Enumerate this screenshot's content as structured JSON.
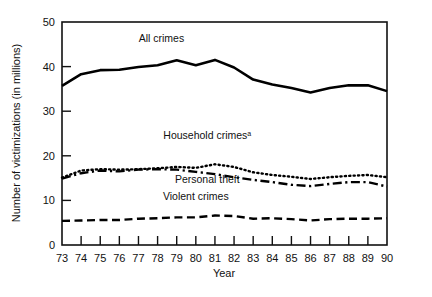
{
  "chart_data": {
    "type": "line",
    "title": "",
    "subtitle": "",
    "xlabel": "Year",
    "ylabel": "Number of victimizations (in millions)",
    "xlim": [
      73,
      90
    ],
    "ylim": [
      0,
      50
    ],
    "grid": false,
    "legend_position": "inline-annotations",
    "x": [
      73,
      74,
      75,
      76,
      77,
      78,
      79,
      80,
      81,
      82,
      83,
      84,
      85,
      86,
      87,
      88,
      89,
      90
    ],
    "xtick_labels": [
      "73",
      "74",
      "75",
      "76",
      "77",
      "78",
      "79",
      "80",
      "81",
      "82",
      "83",
      "84",
      "85",
      "86",
      "87",
      "88",
      "89",
      "90"
    ],
    "ytick_labels": [
      "0",
      "10",
      "20",
      "30",
      "40",
      "50"
    ],
    "yticks": [
      0,
      10,
      20,
      30,
      40,
      50
    ],
    "series": [
      {
        "name": "All crimes",
        "style": "solid",
        "color": "#000000",
        "label_text": "All crimes",
        "label_superscript": "",
        "values": [
          35.7,
          38.3,
          39.2,
          39.3,
          39.9,
          40.3,
          41.4,
          40.3,
          41.5,
          39.8,
          37.1,
          36.0,
          35.2,
          34.2,
          35.2,
          35.8,
          35.8,
          34.5
        ]
      },
      {
        "name": "Household crimes",
        "style": "dotted",
        "color": "#000000",
        "label_text": "Household crimes",
        "label_superscript": "a",
        "values": [
          15.1,
          16.7,
          17.0,
          16.9,
          17.0,
          17.2,
          17.5,
          17.3,
          18.1,
          17.5,
          16.3,
          15.7,
          15.3,
          14.8,
          15.2,
          15.5,
          15.7,
          15.2
        ]
      },
      {
        "name": "Personal theft",
        "style": "dashdot",
        "color": "#000000",
        "label_text": "Personal theft",
        "label_superscript": "",
        "values": [
          14.9,
          16.1,
          16.7,
          16.5,
          16.9,
          17.0,
          16.9,
          16.4,
          15.9,
          15.2,
          14.6,
          14.1,
          13.5,
          13.2,
          13.7,
          14.1,
          14.1,
          13.1
        ]
      },
      {
        "name": "Violent crimes",
        "style": "dashed",
        "color": "#000000",
        "label_text": "Violent crimes",
        "label_superscript": "",
        "values": [
          5.4,
          5.5,
          5.6,
          5.6,
          5.9,
          6.0,
          6.2,
          6.2,
          6.6,
          6.5,
          5.9,
          6.0,
          5.8,
          5.5,
          5.8,
          5.9,
          5.9,
          6.0
        ]
      }
    ],
    "annotations": [
      {
        "text": "All crimes",
        "x": 78.2,
        "y": 45.5
      },
      {
        "text": "Household crimes",
        "x": 80.6,
        "y": 23.8
      },
      {
        "text": "Personal theft",
        "x": 80.6,
        "y": 13.9
      },
      {
        "text": "Violent crimes",
        "x": 80.0,
        "y": 10.2
      }
    ]
  }
}
